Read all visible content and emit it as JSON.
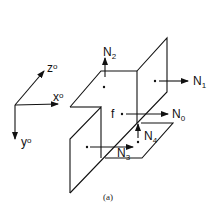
{
  "figure": {
    "caption": "(a)",
    "axes": {
      "x": "x",
      "y": "y",
      "z": "z",
      "sup": "o"
    },
    "labels": {
      "N0": {
        "base": "N",
        "sub": "0"
      },
      "N1": {
        "base": "N",
        "sub": "1"
      },
      "N2": {
        "base": "N",
        "sub": "2"
      },
      "N3": {
        "base": "N",
        "sub": "3"
      },
      "N4": {
        "base": "N",
        "sub": "4"
      },
      "f": "f"
    }
  }
}
